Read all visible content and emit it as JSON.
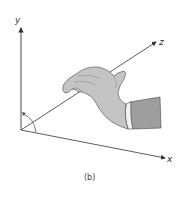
{
  "figure": {
    "caption": "(b)",
    "axes": {
      "y_label": "y",
      "z_label": "z",
      "x_label": "x"
    },
    "colors": {
      "axis": "#333333",
      "hand_fill": "#c4c4c4",
      "sleeve_fill": "#9e9e9e",
      "outline": "#444444"
    }
  }
}
